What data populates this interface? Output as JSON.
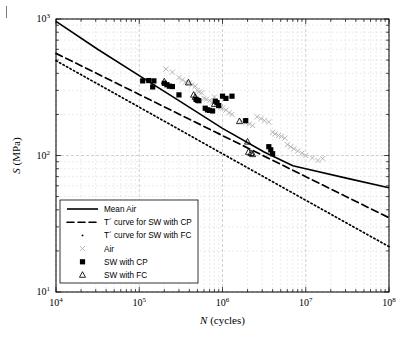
{
  "figure": {
    "title": "",
    "corner_mark": "page-edge-tick"
  },
  "chart_data": {
    "type": "scatter",
    "title": "",
    "xlabel": "N (cycles)",
    "ylabel": "S (MPa)",
    "xscale": "log",
    "yscale": "log",
    "xlim": [
      10000,
      100000000
    ],
    "ylim": [
      10,
      1000
    ],
    "grid": true,
    "xticks": [
      10000,
      100000,
      1000000,
      10000000,
      100000000
    ],
    "xticklabels": [
      "104",
      "105",
      "106",
      "107",
      "108"
    ],
    "xtick_mantissa": [
      "10",
      "10",
      "10",
      "10",
      "10"
    ],
    "xtick_exponent": [
      "4",
      "5",
      "6",
      "7",
      "8"
    ],
    "yticks": [
      10,
      100,
      1000
    ],
    "ytick_mantissa": [
      "10",
      "10",
      "10"
    ],
    "ytick_exponent": [
      "1",
      "2",
      "3"
    ],
    "legend_position": "lower-left",
    "legend_entries": [
      {
        "label": "Mean Air",
        "marker": "line-solid",
        "color": "#000000"
      },
      {
        "label": "T´ curve for SW with CP",
        "marker": "line-dashed",
        "color": "#000000"
      },
      {
        "label": "T´ curve for SW with FC",
        "marker": "line-dotted",
        "color": "#000000"
      },
      {
        "label": "Air",
        "marker": "x",
        "color": "#b0b0b0"
      },
      {
        "label": "SW with CP",
        "marker": "square-filled",
        "color": "#000000"
      },
      {
        "label": "SW with FC",
        "marker": "triangle-open",
        "color": "#000000"
      }
    ],
    "series": [
      {
        "name": "Mean Air",
        "type": "line",
        "style": "solid",
        "color": "#000000",
        "points": [
          [
            10000,
            960
          ],
          [
            31623,
            600
          ],
          [
            100000,
            385
          ],
          [
            316228,
            247
          ],
          [
            1000000,
            158
          ],
          [
            3162278,
            106
          ],
          [
            7000000,
            84
          ],
          [
            10000000,
            80
          ],
          [
            31623000,
            68
          ],
          [
            100000000,
            58
          ]
        ]
      },
      {
        "name": "T´ curve for SW with CP",
        "type": "line",
        "style": "dashed",
        "color": "#000000",
        "points": [
          [
            10000,
            560
          ],
          [
            100000,
            280
          ],
          [
            1000000,
            140
          ],
          [
            10000000,
            70
          ],
          [
            100000000,
            35
          ]
        ]
      },
      {
        "name": "T´ curve for SW with FC",
        "type": "line",
        "style": "dotted",
        "color": "#000000",
        "points": [
          [
            10000,
            495
          ],
          [
            100000,
            226
          ],
          [
            1000000,
            103
          ],
          [
            10000000,
            47
          ],
          [
            100000000,
            21.5
          ]
        ]
      },
      {
        "name": "Air",
        "type": "scatter",
        "marker": "x",
        "color": "#b0b0b0",
        "points": [
          [
            210000,
            430
          ],
          [
            250000,
            408
          ],
          [
            300000,
            372
          ],
          [
            330000,
            358
          ],
          [
            360000,
            345
          ],
          [
            400000,
            340
          ],
          [
            430000,
            330
          ],
          [
            470000,
            322
          ],
          [
            500000,
            300
          ],
          [
            520000,
            292
          ],
          [
            560000,
            288
          ],
          [
            600000,
            262
          ],
          [
            640000,
            258
          ],
          [
            700000,
            252
          ],
          [
            760000,
            246
          ],
          [
            800000,
            268
          ],
          [
            850000,
            240
          ],
          [
            900000,
            232
          ],
          [
            950000,
            226
          ],
          [
            1000000,
            222
          ],
          [
            1100000,
            215
          ],
          [
            1200000,
            206
          ],
          [
            1300000,
            200
          ],
          [
            1700000,
            180
          ],
          [
            1900000,
            174
          ],
          [
            2100000,
            170
          ],
          [
            2300000,
            166
          ],
          [
            2600000,
            192
          ],
          [
            2900000,
            186
          ],
          [
            3200000,
            180
          ],
          [
            3600000,
            176
          ],
          [
            4000000,
            148
          ],
          [
            4300000,
            144
          ],
          [
            4700000,
            140
          ],
          [
            5100000,
            138
          ],
          [
            5600000,
            134
          ],
          [
            6000000,
            120
          ],
          [
            6600000,
            116
          ],
          [
            7200000,
            112
          ],
          [
            8000000,
            108
          ],
          [
            9000000,
            104
          ],
          [
            10000000,
            100
          ],
          [
            12000000,
            96
          ],
          [
            14000000,
            92
          ],
          [
            16000000,
            95
          ]
        ]
      },
      {
        "name": "SW with CP",
        "type": "scatter",
        "marker": "square-filled",
        "color": "#000000",
        "points": [
          [
            110000,
            352
          ],
          [
            130000,
            354
          ],
          [
            150000,
            352
          ],
          [
            145000,
            318
          ],
          [
            200000,
            338
          ],
          [
            215000,
            330
          ],
          [
            230000,
            322
          ],
          [
            250000,
            320
          ],
          [
            300000,
            278
          ],
          [
            480000,
            258
          ],
          [
            500000,
            254
          ],
          [
            520000,
            252
          ],
          [
            620000,
            222
          ],
          [
            660000,
            216
          ],
          [
            700000,
            214
          ],
          [
            760000,
            212
          ],
          [
            820000,
            250
          ],
          [
            860000,
            244
          ],
          [
            900000,
            232
          ],
          [
            1000000,
            272
          ],
          [
            1100000,
            262
          ],
          [
            1300000,
            272
          ],
          [
            1900000,
            180
          ],
          [
            3600000,
            116
          ],
          [
            3800000,
            110
          ],
          [
            4000000,
            103
          ]
        ]
      },
      {
        "name": "SW with FC",
        "type": "scatter",
        "marker": "triangle-open",
        "color": "#000000",
        "points": [
          [
            200000,
            348
          ],
          [
            390000,
            342
          ],
          [
            450000,
            278
          ],
          [
            470000,
            268
          ],
          [
            800000,
            238
          ],
          [
            1600000,
            178
          ],
          [
            2000000,
            126
          ],
          [
            2050000,
            106
          ],
          [
            2200000,
            104
          ],
          [
            2300000,
            102
          ]
        ]
      }
    ]
  }
}
